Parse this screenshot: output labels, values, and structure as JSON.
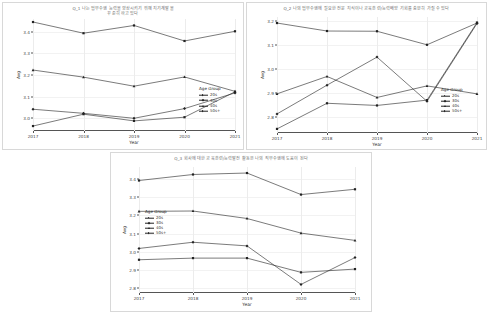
{
  "page": {
    "background": "#ffffff",
    "line_color": "#222222"
  },
  "legend": {
    "title": "Age Group",
    "entries": [
      "20s",
      "30s",
      "40s",
      "50s+"
    ]
  },
  "axis": {
    "xlabel": "Year",
    "ylabel": "Avg",
    "years": [
      "2017",
      "2018",
      "2019",
      "2020",
      "2021"
    ]
  },
  "charts": [
    {
      "id": "chart-1",
      "title": "Q_1 나는 업무수행 능력을 향상시키기 위해 지기계발을\n꾸준히 하고 있다",
      "legend_position": "bottom-right"
    },
    {
      "id": "chart-2",
      "title": "Q_2 나의 업무수행에 필요한 전문 지식이나 교육훈련/능력배양 기회를 충분히 가질 수 있다",
      "legend_position": "bottom-right"
    },
    {
      "id": "chart-3",
      "title": "Q_3 회사에 대한 교육훈련/능력발전 활동은 나의 직무수행에 도움이 된다",
      "legend_position": "middle-left"
    }
  ],
  "chart_data": [
    {
      "type": "line",
      "title": "Q_1 나는 업무수행 능력을 향상시키기 위해 지기계발을\n꾸준히 하고 있다",
      "xlabel": "Year",
      "ylabel": "Avg",
      "categories": [
        "2017",
        "2018",
        "2019",
        "2020",
        "2021"
      ],
      "ylim": [
        2.94,
        3.46
      ],
      "yticks": [
        3.0,
        3.1,
        3.2,
        3.3,
        3.4
      ],
      "grid": true,
      "legend": "Age Group",
      "series": [
        {
          "name": "20s",
          "values": [
            2.963,
            3.018,
            2.987,
            3.004,
            3.122
          ]
        },
        {
          "name": "30s",
          "values": [
            3.041,
            3.022,
            2.999,
            3.044,
            3.117
          ]
        },
        {
          "name": "40s",
          "values": [
            3.223,
            3.19,
            3.148,
            3.191,
            3.124
          ]
        },
        {
          "name": "50s+",
          "values": [
            3.446,
            3.394,
            3.43,
            3.358,
            3.403
          ]
        }
      ]
    },
    {
      "type": "line",
      "title": "Q_2 나의 업무수행에 필요한 전문 지식이나 교육훈련/능력배양 기회를 충분히 가질 수 있다",
      "xlabel": "Year",
      "ylabel": "Avg",
      "categories": [
        "2017",
        "2018",
        "2019",
        "2020",
        "2021"
      ],
      "ylim": [
        2.735,
        3.215
      ],
      "yticks": [
        2.8,
        2.9,
        3.0,
        3.1,
        3.2
      ],
      "grid": true,
      "legend": "Age Group",
      "series": [
        {
          "name": "20s",
          "values": [
            2.752,
            2.858,
            2.849,
            2.871,
            3.192
          ]
        },
        {
          "name": "30s",
          "values": [
            2.814,
            2.933,
            3.049,
            2.866,
            3.188
          ]
        },
        {
          "name": "40s",
          "values": [
            2.897,
            2.969,
            2.882,
            2.93,
            2.897
          ]
        },
        {
          "name": "50s+",
          "values": [
            3.19,
            3.157,
            3.156,
            3.1,
            3.19
          ]
        }
      ]
    },
    {
      "type": "line",
      "title": "Q_3 회사에 대한 교육훈련/능력발전 활동은 나의 직무수행에 도움이 된다",
      "xlabel": "Year",
      "ylabel": "Avg",
      "categories": [
        "2017",
        "2018",
        "2019",
        "2020",
        "2021"
      ],
      "ylim": [
        2.775,
        3.465
      ],
      "yticks": [
        2.8,
        2.9,
        3.0,
        3.1,
        3.2,
        3.3,
        3.4
      ],
      "grid": true,
      "legend": "Age Group",
      "series": [
        {
          "name": "20s",
          "values": [
            2.957,
            2.966,
            2.966,
            2.888,
            2.906
          ]
        },
        {
          "name": "30s",
          "values": [
            3.019,
            3.053,
            3.033,
            2.822,
            2.969
          ]
        },
        {
          "name": "40s",
          "values": [
            3.222,
            3.224,
            3.183,
            3.103,
            3.063
          ]
        },
        {
          "name": "50s+",
          "values": [
            3.391,
            3.424,
            3.432,
            3.314,
            3.343
          ]
        }
      ]
    }
  ]
}
